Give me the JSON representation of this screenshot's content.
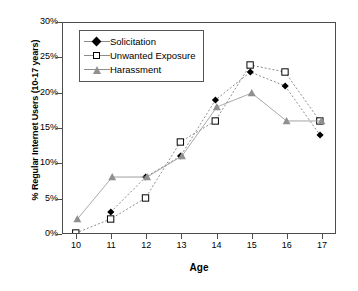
{
  "chart_data": {
    "type": "line",
    "title": "",
    "xlabel": "Age",
    "ylabel": "% Regular Internet Users (10-17 years)",
    "x": [
      10,
      11,
      12,
      13,
      14,
      15,
      16,
      17
    ],
    "xtick_labels": [
      "10",
      "11",
      "12",
      "13",
      "14",
      "15",
      "16",
      "17"
    ],
    "ytick_labels": [
      "0%",
      "5%",
      "10%",
      "15%",
      "20%",
      "25%",
      "30%"
    ],
    "ytick_values": [
      0,
      5,
      10,
      15,
      20,
      25,
      30
    ],
    "xlim": [
      9.6,
      17.4
    ],
    "ylim": [
      0,
      30
    ],
    "grid": false,
    "legend_position": "upper left",
    "series": [
      {
        "name": "Solicitation",
        "marker": "filled-diamond",
        "color": "#000000",
        "line_color": "#8c8c8c",
        "values": [
          null,
          3,
          8,
          11,
          19,
          23,
          21,
          14
        ]
      },
      {
        "name": "Unwanted Exposure",
        "marker": "open-square",
        "color": "#000000",
        "line_color": "#8c8c8c",
        "values": [
          0,
          2,
          5,
          13,
          16,
          24,
          23,
          16
        ]
      },
      {
        "name": "Harassment",
        "marker": "filled-triangle",
        "color": "#909090",
        "line_color": "#9a9a9a",
        "values": [
          2,
          8,
          8,
          11,
          18,
          20,
          16,
          16
        ]
      }
    ]
  },
  "legend": {
    "items": [
      {
        "label": "Solicitation"
      },
      {
        "label": "Unwanted Exposure"
      },
      {
        "label": "Harassment"
      }
    ]
  }
}
